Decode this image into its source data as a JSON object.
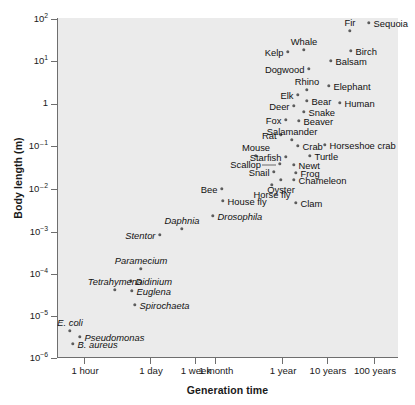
{
  "chart_data": {
    "type": "scatter",
    "title": "",
    "xlabel": "Generation time",
    "ylabel": "Body length (m)",
    "xscale": "log",
    "yscale": "log",
    "grid": false,
    "legend": null,
    "plot_background": "#ebebeb",
    "point_color": "#5d5d5d",
    "x_tick_labels": [
      "1 hour",
      "1 day",
      "1 week",
      "1 month",
      "1 year",
      "10 years",
      "100 years"
    ],
    "x_tick_px": [
      84,
      150,
      195,
      215,
      282,
      327,
      374
    ],
    "y_tick_labels": [
      "10²",
      "10¹",
      "1",
      "10⁻¹",
      "10⁻²",
      "10⁻³",
      "10⁻⁴",
      "10⁻⁵",
      "10⁻⁶"
    ],
    "y_tick_values": [
      100,
      10,
      1,
      0.1,
      0.01,
      0.001,
      0.0001,
      1e-05,
      1e-06
    ],
    "y_tick_px": [
      19,
      61,
      104,
      146,
      189,
      232,
      274,
      316,
      358
    ],
    "ylim": [
      1e-06,
      100.0
    ],
    "points": [
      {
        "label": "Sequoia",
        "x": 369,
        "y": 23,
        "place": "right",
        "italic": false,
        "body_length_m": 60,
        "generation_time": "~100 years"
      },
      {
        "label": "Fir",
        "x": 350,
        "y": 31,
        "place": "above",
        "italic": false,
        "body_length_m": 40,
        "generation_time": "~50 years"
      },
      {
        "label": "Whale",
        "x": 304,
        "y": 50,
        "place": "above",
        "italic": false,
        "body_length_m": 20,
        "generation_time": "~10 years"
      },
      {
        "label": "Birch",
        "x": 351,
        "y": 51,
        "place": "right",
        "italic": false,
        "body_length_m": 18,
        "generation_time": "~50 years"
      },
      {
        "label": "Kelp",
        "x": 288,
        "y": 52,
        "place": "left",
        "italic": false,
        "body_length_m": 18,
        "generation_time": "~1 year"
      },
      {
        "label": "Balsam",
        "x": 331,
        "y": 61,
        "place": "right",
        "italic": false,
        "body_length_m": 11,
        "generation_time": "~30 years"
      },
      {
        "label": "Dogwood",
        "x": 309,
        "y": 69,
        "place": "left",
        "italic": false,
        "body_length_m": 7,
        "generation_time": "~10 years"
      },
      {
        "label": "Elephant",
        "x": 329,
        "y": 86,
        "place": "right",
        "italic": false,
        "body_length_m": 3.5,
        "generation_time": "~20 years"
      },
      {
        "label": "Rhino",
        "x": 307,
        "y": 90,
        "place": "above",
        "italic": false,
        "body_length_m": 2.8,
        "generation_time": "~10 years"
      },
      {
        "label": "Elk",
        "x": 298,
        "y": 95,
        "place": "left",
        "italic": false,
        "body_length_m": 2.2,
        "generation_time": "~6 years"
      },
      {
        "label": "Bear",
        "x": 307,
        "y": 101,
        "place": "right",
        "italic": false,
        "body_length_m": 1.7,
        "generation_time": "~8 years"
      },
      {
        "label": "Human",
        "x": 340,
        "y": 103,
        "place": "right",
        "italic": false,
        "body_length_m": 1.6,
        "generation_time": "~25 years"
      },
      {
        "label": "Deer",
        "x": 294,
        "y": 106,
        "place": "left",
        "italic": false,
        "body_length_m": 1.3,
        "generation_time": "~4 years"
      },
      {
        "label": "Snake",
        "x": 304,
        "y": 112,
        "place": "right",
        "italic": false,
        "body_length_m": 0.9,
        "generation_time": "~5 years"
      },
      {
        "label": "Fox",
        "x": 286,
        "y": 120,
        "place": "left",
        "italic": false,
        "body_length_m": 0.6,
        "generation_time": "~2 years"
      },
      {
        "label": "Beaver",
        "x": 299,
        "y": 121,
        "place": "right",
        "italic": false,
        "body_length_m": 0.55,
        "generation_time": "~3 years"
      },
      {
        "label": "Rat",
        "x": 281,
        "y": 135,
        "place": "left",
        "italic": false,
        "body_length_m": 0.22,
        "generation_time": "~8 months"
      },
      {
        "label": "Salamander",
        "x": 292,
        "y": 140,
        "place": "above",
        "italic": false,
        "body_length_m": 0.18,
        "generation_time": "~1 year"
      },
      {
        "label": "Crab",
        "x": 298,
        "y": 146,
        "place": "right",
        "italic": false,
        "body_length_m": 0.14,
        "generation_time": "~1.5 years"
      },
      {
        "label": "Horseshoe crab",
        "x": 325,
        "y": 145,
        "place": "right",
        "italic": false,
        "body_length_m": 0.15,
        "generation_time": "~12 years"
      },
      {
        "label": "Mouse",
        "x": 256,
        "y": 156,
        "place": "above",
        "italic": false,
        "body_length_m": 0.08,
        "generation_time": "~3 months"
      },
      {
        "label": "Starfish",
        "x": 286,
        "y": 157,
        "place": "left",
        "italic": false,
        "body_length_m": 0.08,
        "generation_time": "~1 year"
      },
      {
        "label": "Turtle",
        "x": 310,
        "y": 156,
        "place": "right",
        "italic": false,
        "body_length_m": 0.09,
        "generation_time": "~5 years"
      },
      {
        "label": "Scallop",
        "x": 280,
        "y": 164,
        "place": "leader",
        "italic": false,
        "body_length_m": 0.06,
        "generation_time": "~1 year"
      },
      {
        "label": "Newt",
        "x": 294,
        "y": 165,
        "place": "right",
        "italic": false,
        "body_length_m": 0.055,
        "generation_time": "~1.5 years"
      },
      {
        "label": "Frog",
        "x": 296,
        "y": 173,
        "place": "right",
        "italic": false,
        "body_length_m": 0.04,
        "generation_time": "~2 years"
      },
      {
        "label": "Snail",
        "x": 274,
        "y": 172,
        "place": "left",
        "italic": false,
        "body_length_m": 0.04,
        "generation_time": "~1 year"
      },
      {
        "label": "Chameleon",
        "x": 294,
        "y": 180,
        "place": "right",
        "italic": false,
        "body_length_m": 0.028,
        "generation_time": "~2 years"
      },
      {
        "label": "Oyster",
        "x": 281,
        "y": 180,
        "place": "below",
        "italic": false,
        "body_length_m": 0.028,
        "generation_time": "~1 year"
      },
      {
        "label": "Bee",
        "x": 222,
        "y": 189,
        "place": "left",
        "italic": false,
        "body_length_m": 0.013,
        "generation_time": "~2 months"
      },
      {
        "label": "Horse fly",
        "x": 272,
        "y": 185,
        "place": "below",
        "italic": false,
        "body_length_m": 0.018,
        "generation_time": "~1 year"
      },
      {
        "label": "House fly",
        "x": 223,
        "y": 201,
        "place": "right",
        "italic": false,
        "body_length_m": 0.006,
        "generation_time": "~1 month"
      },
      {
        "label": "Clam",
        "x": 296,
        "y": 203,
        "place": "right",
        "italic": false,
        "body_length_m": 0.006,
        "generation_time": "~2 years"
      },
      {
        "label": "Drosophila",
        "x": 213,
        "y": 216,
        "place": "right",
        "italic": true,
        "body_length_m": 0.003,
        "generation_time": "~2 weeks"
      },
      {
        "label": "Daphnia",
        "x": 182,
        "y": 229,
        "place": "above",
        "italic": true,
        "body_length_m": 0.0013,
        "generation_time": "~1 week"
      },
      {
        "label": "Stentor",
        "x": 160,
        "y": 235,
        "place": "left",
        "italic": true,
        "body_length_m": 0.001,
        "generation_time": "~2 days"
      },
      {
        "label": "Paramecium",
        "x": 141,
        "y": 269,
        "place": "above",
        "italic": true,
        "body_length_m": 0.00018,
        "generation_time": "~1 day"
      },
      {
        "label": "Didinium",
        "x": 131,
        "y": 281,
        "place": "right",
        "italic": true,
        "body_length_m": 0.0001,
        "generation_time": "~18 hours"
      },
      {
        "label": "Tetrahymena",
        "x": 115,
        "y": 290,
        "place": "above",
        "italic": true,
        "body_length_m": 5e-05,
        "generation_time": "~6 hours"
      },
      {
        "label": "Euglena",
        "x": 132,
        "y": 291,
        "place": "right",
        "italic": true,
        "body_length_m": 4e-05,
        "generation_time": "~20 hours"
      },
      {
        "label": "Spirochaeta",
        "x": 135,
        "y": 305,
        "place": "right",
        "italic": true,
        "body_length_m": 1.5e-05,
        "generation_time": "~1 day"
      },
      {
        "label": "E. coli",
        "x": 70,
        "y": 331,
        "place": "above",
        "italic": true,
        "body_length_m": 3.5e-06,
        "generation_time": "~20 minutes"
      },
      {
        "label": "Pseudomonas",
        "x": 80,
        "y": 337,
        "place": "right",
        "italic": true,
        "body_length_m": 3e-06,
        "generation_time": "~30 minutes"
      },
      {
        "label": "B. aureus",
        "x": 73,
        "y": 344,
        "place": "right",
        "italic": true,
        "body_length_m": 2.2e-06,
        "generation_time": "~25 minutes"
      }
    ]
  }
}
